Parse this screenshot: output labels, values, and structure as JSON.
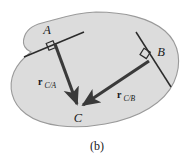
{
  "figure": {
    "caption": "(b)",
    "background_color": "#ffffff",
    "body_fill_color": "#dcdcdc",
    "body_outline_color": "#9a9a9a",
    "line_color": "#2b2b2b",
    "vector_color": "#3a3a3a",
    "label_color": "#1a1a1a",
    "points": [
      {
        "id": "A",
        "label": "A",
        "x": 53,
        "y": 40
      },
      {
        "id": "B",
        "label": "B",
        "x": 152,
        "y": 58
      },
      {
        "id": "C",
        "label": "C",
        "x": 78,
        "y": 108
      }
    ],
    "vectors": [
      {
        "id": "r_C_A",
        "symbol": "r",
        "subscript": "C/A",
        "from": "A",
        "to": "C",
        "label_x": 46,
        "label_y": 82
      },
      {
        "id": "r_C_B",
        "symbol": "r",
        "subscript": "C/B",
        "from": "B",
        "to": "C",
        "label_x": 124,
        "label_y": 95
      }
    ],
    "right_angle_markers": [
      {
        "id": "at-A",
        "at": "A"
      },
      {
        "id": "at-B",
        "at": "B"
      }
    ],
    "reference_lines": [
      {
        "id": "line-through-A",
        "through": "A"
      },
      {
        "id": "line-through-B",
        "through": "B"
      }
    ]
  }
}
